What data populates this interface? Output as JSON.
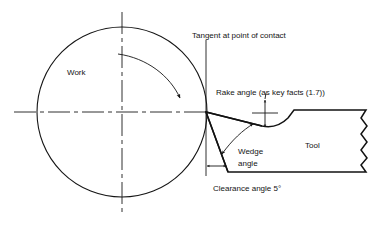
{
  "diagram": {
    "labels": {
      "work": "Work",
      "tool": "Tool",
      "tangent": "Tangent at point of contact",
      "rake_angle": "Rake angle (as key facts (1.7))",
      "wedge_angle_line1": "Wedge",
      "wedge_angle_line2": "angle",
      "clearance_angle": "Clearance angle 5°"
    },
    "colors": {
      "ink": "#141414",
      "background": "#ffffff"
    },
    "geometry": {
      "workpiece_center_x": 122,
      "workpiece_center_y": 112,
      "workpiece_radius": 85,
      "contact_point_x": 206,
      "contact_point_y": 112,
      "tangent_line_top_y": 40,
      "tangent_line_bottom_y": 176,
      "tool_top_surface_y": 110,
      "tool_bottom_surface_y": 172,
      "tool_right_edge_x": 366,
      "clearance_angle_degrees": 5
    }
  }
}
